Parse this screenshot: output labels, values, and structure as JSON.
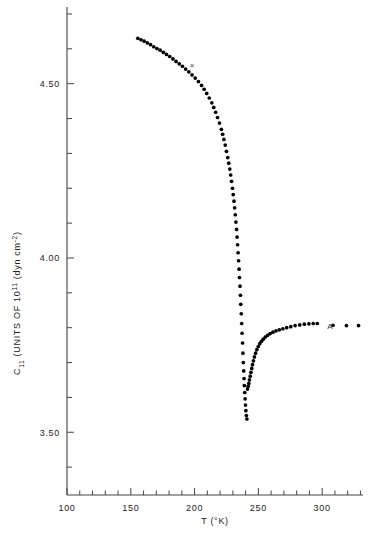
{
  "chart_data": {
    "type": "scatter",
    "title": "",
    "xlabel": "T (°K)",
    "ylabel": "C11 (UNITS OF 10¹¹  (dyn cm⁻²)",
    "ylabel_parts": {
      "symbol": "C",
      "subscript": "11",
      "text_a": "(UNITS OF 10",
      "superscript_a": "11",
      "text_b": "(dyn cm",
      "superscript_b": "-2",
      "text_c": ")"
    },
    "xlim": [
      100,
      332
    ],
    "ylim": [
      3.32,
      4.72
    ],
    "x_major_ticks": [
      100,
      150,
      200,
      250,
      300
    ],
    "x_major_tick_labels": [
      "100",
      "150",
      "200",
      "250",
      "300"
    ],
    "x_minor_tick_step": 10,
    "y_major_ticks": [
      3.5,
      4.0,
      4.5
    ],
    "y_major_tick_labels": [
      "3.50",
      "4.00",
      "4.50"
    ],
    "y_minor_tick_step": 0.1,
    "grid": false,
    "legend": null,
    "annotations": [
      {
        "name": "curve-label-A",
        "text": "A",
        "x": 306,
        "y": 3.795
      },
      {
        "name": "cross-marker",
        "text": "×",
        "x": 198,
        "y": 4.545
      }
    ],
    "series": [
      {
        "name": "upper-branch",
        "marker": "filled-circle",
        "color": "#000000",
        "points": [
          [
            155.5,
            4.63
          ],
          [
            158.0,
            4.626
          ],
          [
            160.5,
            4.622
          ],
          [
            163.0,
            4.617
          ],
          [
            165.5,
            4.612
          ],
          [
            168.0,
            4.606
          ],
          [
            170.5,
            4.601
          ],
          [
            173.0,
            4.596
          ],
          [
            175.5,
            4.59
          ],
          [
            178.0,
            4.584
          ],
          [
            180.5,
            4.578
          ],
          [
            183.0,
            4.571
          ],
          [
            185.5,
            4.564
          ],
          [
            188.0,
            4.557
          ],
          [
            190.5,
            4.55
          ],
          [
            193.0,
            4.542
          ],
          [
            195.5,
            4.534
          ],
          [
            198.0,
            4.525
          ],
          [
            200.5,
            4.516
          ],
          [
            203.0,
            4.506
          ],
          [
            205.5,
            4.495
          ],
          [
            207.5,
            4.484
          ],
          [
            209.5,
            4.472
          ],
          [
            211.5,
            4.459
          ],
          [
            213.5,
            4.445
          ],
          [
            215.0,
            4.432
          ],
          [
            216.5,
            4.418
          ],
          [
            218.0,
            4.403
          ],
          [
            219.5,
            4.387
          ],
          [
            221.0,
            4.369
          ],
          [
            222.0,
            4.355
          ],
          [
            223.0,
            4.34
          ],
          [
            224.0,
            4.324
          ],
          [
            225.0,
            4.306
          ],
          [
            226.0,
            4.288
          ],
          [
            226.8,
            4.272
          ],
          [
            227.6,
            4.255
          ],
          [
            228.3,
            4.238
          ],
          [
            229.0,
            4.22
          ],
          [
            229.7,
            4.2
          ],
          [
            230.3,
            4.182
          ],
          [
            230.9,
            4.163
          ],
          [
            231.4,
            4.144
          ],
          [
            231.9,
            4.124
          ],
          [
            232.4,
            4.103
          ],
          [
            232.9,
            4.082
          ],
          [
            233.3,
            4.06
          ],
          [
            233.7,
            4.038
          ],
          [
            234.1,
            4.015
          ],
          [
            234.5,
            3.992
          ],
          [
            234.9,
            3.968
          ],
          [
            235.2,
            3.944
          ],
          [
            235.6,
            3.919
          ],
          [
            235.9,
            3.893
          ],
          [
            236.2,
            3.867
          ],
          [
            236.6,
            3.84
          ],
          [
            236.9,
            3.812
          ],
          [
            237.2,
            3.784
          ],
          [
            237.6,
            3.756
          ],
          [
            237.9,
            3.727
          ],
          [
            238.2,
            3.7
          ],
          [
            238.5,
            3.676
          ],
          [
            238.8,
            3.654
          ],
          [
            239.0,
            3.634
          ],
          [
            239.3,
            3.614
          ],
          [
            239.6,
            3.596
          ],
          [
            239.9,
            3.578
          ],
          [
            240.2,
            3.562
          ],
          [
            240.6,
            3.548
          ],
          [
            241.0,
            3.538
          ]
        ]
      },
      {
        "name": "lower-branch",
        "marker": "filled-circle",
        "color": "#000000",
        "points": [
          [
            241.5,
            3.624
          ],
          [
            242.0,
            3.632
          ],
          [
            242.5,
            3.64
          ],
          [
            243.0,
            3.65
          ],
          [
            243.6,
            3.661
          ],
          [
            244.2,
            3.672
          ],
          [
            244.8,
            3.683
          ],
          [
            245.4,
            3.694
          ],
          [
            246.1,
            3.705
          ],
          [
            246.9,
            3.716
          ],
          [
            247.8,
            3.727
          ],
          [
            248.8,
            3.737
          ],
          [
            249.9,
            3.746
          ],
          [
            251.1,
            3.754
          ],
          [
            252.4,
            3.761
          ],
          [
            253.8,
            3.767
          ],
          [
            255.4,
            3.773
          ],
          [
            257.2,
            3.778
          ],
          [
            259.2,
            3.783
          ],
          [
            261.4,
            3.787
          ],
          [
            263.8,
            3.791
          ],
          [
            266.4,
            3.794
          ],
          [
            269.2,
            3.797
          ],
          [
            272.2,
            3.8
          ],
          [
            275.4,
            3.803
          ],
          [
            278.8,
            3.806
          ],
          [
            282.4,
            3.808
          ],
          [
            286.0,
            3.81
          ],
          [
            289.6,
            3.811
          ],
          [
            293.0,
            3.812
          ],
          [
            296.2,
            3.812
          ],
          [
            308.5,
            3.807
          ],
          [
            319.0,
            3.806
          ],
          [
            328.5,
            3.806
          ]
        ]
      }
    ]
  },
  "axes": {
    "x_axis_name": "temperature-axis",
    "y_axis_name": "elastic-constant-axis"
  }
}
